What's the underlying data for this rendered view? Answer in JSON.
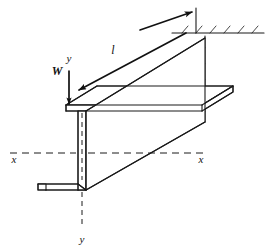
{
  "figure": {
    "kind": "engineering-line-drawing",
    "background_color": "#ffffff",
    "line_color": "#1a1a1a",
    "width_px": 269,
    "height_px": 250
  },
  "labels": {
    "load": "W",
    "length": "l",
    "axis_y_top": "y",
    "axis_y_bottom": "y",
    "axis_x_left": "x",
    "axis_x_right": "x"
  },
  "annotations": {
    "load_description": "Concentrated tip load W applied downward at the free end top corner",
    "length_description": "Span dimension l measured along the beam from free end to fixed support",
    "support_description": "Fixed (built-in) end shown with hatched wall lines",
    "axis_x_description": "Horizontal centroidal axis x-x drawn as a chain/dashed centerline",
    "axis_y_description": "Vertical centroidal axis y-y drawn as a chain/dashed centerline"
  },
  "geometry": {
    "section_type": "Z-section",
    "free_end_x": 66,
    "fixed_end_x": 214,
    "top_flange_y": 105,
    "bottom_flange_y": 190,
    "web_center_x": 86,
    "x_axis_y": 153,
    "hatch_marks_top_count": 6,
    "hatch_marks_side_count": 5
  },
  "icons": {
    "load_arrow": "arrow-down",
    "dimension_arrow": "arrow-diagonal",
    "support_arrow": "arrow-up-right"
  }
}
